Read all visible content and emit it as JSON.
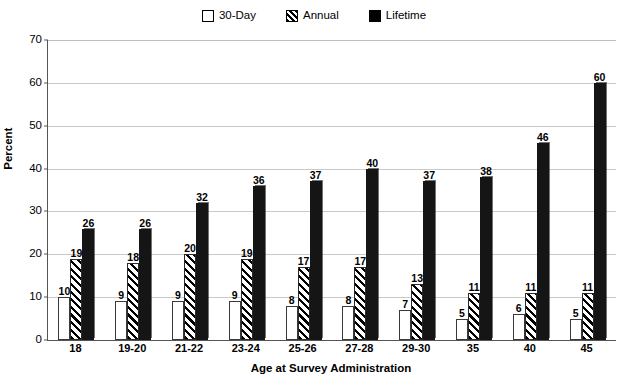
{
  "chart_data": {
    "type": "bar",
    "title": "",
    "xlabel": "Age at Survey Administration",
    "ylabel": "Percent",
    "ylim": [
      0,
      70
    ],
    "ytick_step": 10,
    "yticks": [
      0,
      10,
      20,
      30,
      40,
      50,
      60,
      70
    ],
    "grid": true,
    "legend_position": "top-center",
    "categories": [
      "18",
      "19-20",
      "21-22",
      "23-24",
      "25-26",
      "27-28",
      "29-30",
      "35",
      "40",
      "45"
    ],
    "series": [
      {
        "name": "30-Day",
        "style": "open",
        "color": "#ffffff",
        "values": [
          10,
          9,
          9,
          9,
          8,
          8,
          7,
          5,
          6,
          5
        ]
      },
      {
        "name": "Annual",
        "style": "hatched",
        "color": "#000000",
        "values": [
          19,
          18,
          20,
          19,
          17,
          17,
          13,
          11,
          11,
          11
        ]
      },
      {
        "name": "Lifetime",
        "style": "filled",
        "color": "#151515",
        "values": [
          26,
          26,
          32,
          36,
          37,
          40,
          37,
          38,
          46,
          60
        ]
      }
    ]
  }
}
